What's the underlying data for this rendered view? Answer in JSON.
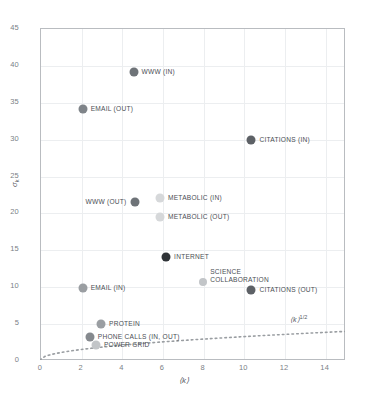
{
  "chart_data": {
    "type": "scatter",
    "title": "",
    "xlabel": "⟨k⟩",
    "ylabel": "σ",
    "ylabel_sub": "k",
    "xlim": [
      0,
      15
    ],
    "ylim": [
      0,
      45
    ],
    "xticks": [
      "0",
      "2",
      "4",
      "6",
      "8",
      "10",
      "12",
      "14"
    ],
    "xtick_values": [
      0,
      2,
      4,
      6,
      8,
      10,
      12,
      14
    ],
    "yticks": [
      "0",
      "5",
      "10",
      "15",
      "20",
      "25",
      "30",
      "35",
      "40",
      "45"
    ],
    "ytick_values": [
      0,
      5,
      10,
      15,
      20,
      25,
      30,
      35,
      40,
      45
    ],
    "grid": true,
    "legend": "none",
    "annotation": {
      "text": "⟨k⟩",
      "exponent": "1/2",
      "curve": "dotted reference line y = ⟨k⟩^(1/2)"
    },
    "points": [
      {
        "label": "WWW (IN)",
        "x": 4.6,
        "y": 39.0,
        "color": "#6e7378",
        "size": 9,
        "label_side": "right"
      },
      {
        "label": "EMAIL (OUT)",
        "x": 2.1,
        "y": 34.0,
        "color": "#7f8489",
        "size": 9,
        "label_side": "right"
      },
      {
        "label": "CITATIONS (IN)",
        "x": 10.4,
        "y": 29.8,
        "color": "#5d6166",
        "size": 9,
        "label_side": "right"
      },
      {
        "label": "WWW (OUT)",
        "x": 4.65,
        "y": 21.4,
        "color": "#6e7378",
        "size": 9,
        "label_side": "left"
      },
      {
        "label": "METABOLIC (IN)",
        "x": 5.9,
        "y": 22.0,
        "color": "#d6d8da",
        "size": 9,
        "label_side": "right"
      },
      {
        "label": "METABOLIC (OUT)",
        "x": 5.9,
        "y": 19.4,
        "color": "#d6d8da",
        "size": 9,
        "label_side": "right"
      },
      {
        "label": "INTERNET",
        "x": 6.2,
        "y": 14.0,
        "color": "#2f3337",
        "size": 9,
        "label_side": "right"
      },
      {
        "label": "SCIENCE COLLABORATION",
        "x": 8.0,
        "y": 10.6,
        "color": "#c2c5c8",
        "size": 8,
        "label_side": "right",
        "label_lines": [
          "SCIENCE",
          "COLLABORATION"
        ],
        "label_above": true
      },
      {
        "label": "CITATIONS (OUT)",
        "x": 10.4,
        "y": 9.5,
        "color": "#5d6166",
        "size": 9,
        "label_side": "right"
      },
      {
        "label": "EMAIL (IN)",
        "x": 2.1,
        "y": 9.7,
        "color": "#9a9ea2",
        "size": 9,
        "label_side": "right"
      },
      {
        "label": "PROTEIN",
        "x": 3.0,
        "y": 4.9,
        "color": "#9a9ea2",
        "size": 9,
        "label_side": "right"
      },
      {
        "label": "PHONE CALLS (IN, OUT)",
        "x": 2.45,
        "y": 3.1,
        "color": "#85898e",
        "size": 9,
        "label_side": "right"
      },
      {
        "label": "POWER GRID",
        "x": 2.75,
        "y": 2.0,
        "color": "#c2c5c8",
        "size": 9,
        "label_side": "right"
      }
    ]
  }
}
